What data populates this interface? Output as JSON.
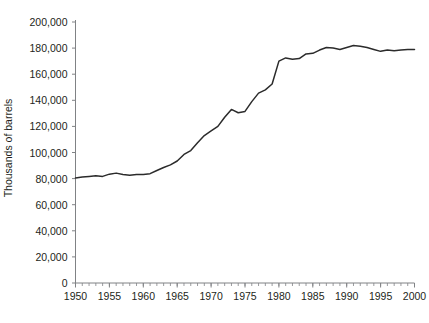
{
  "chart_data": {
    "type": "line",
    "title": "",
    "xlabel": "",
    "ylabel": "Thousands of barrels",
    "xlim": [
      1950,
      2000
    ],
    "ylim": [
      0,
      200000
    ],
    "grid": false,
    "legend": null,
    "line_color": "#2b2b2b",
    "axis_color": "#808285",
    "y_ticks": [
      0,
      20000,
      40000,
      60000,
      80000,
      100000,
      120000,
      140000,
      160000,
      180000,
      200000
    ],
    "y_tick_labels": [
      "0",
      "20,000",
      "40,000",
      "60,000",
      "80,000",
      "100,000",
      "120,000",
      "140,000",
      "160,000",
      "180,000",
      "200,000"
    ],
    "x_ticks": [
      1950,
      1955,
      1960,
      1965,
      1970,
      1975,
      1980,
      1985,
      1990,
      1995,
      2000
    ],
    "x_tick_labels": [
      "1950",
      "1955",
      "1960",
      "1965",
      "1970",
      "1975",
      "1980",
      "1985",
      "1990",
      "1995",
      "2000"
    ],
    "x_minor_tick_step": 1,
    "series": [
      {
        "name": "Petroleum products supplied",
        "x": [
          1950,
          1951,
          1952,
          1953,
          1954,
          1955,
          1956,
          1957,
          1958,
          1959,
          1960,
          1961,
          1962,
          1963,
          1964,
          1965,
          1966,
          1967,
          1968,
          1969,
          1970,
          1971,
          1972,
          1973,
          1974,
          1975,
          1976,
          1977,
          1978,
          1979,
          1980,
          1981,
          1982,
          1983,
          1984,
          1985,
          1986,
          1987,
          1988,
          1989,
          1990,
          1991,
          1992,
          1993,
          1994,
          1995,
          1996,
          1997,
          1998,
          1999,
          2000
        ],
        "values": [
          80500,
          81200,
          81600,
          82100,
          81700,
          83400,
          84200,
          83200,
          82600,
          83200,
          83100,
          83800,
          86200,
          88500,
          90500,
          93500,
          98500,
          101500,
          107500,
          113000,
          116500,
          120000,
          127000,
          133000,
          130500,
          131500,
          139000,
          145500,
          148000,
          152500,
          170000,
          172500,
          171500,
          172000,
          175500,
          176000,
          178500,
          180500,
          180000,
          179000,
          180500,
          182000,
          181500,
          180500,
          179000,
          177500,
          178500,
          178000,
          178500,
          179000,
          179000
        ]
      }
    ]
  },
  "axes": {
    "y_title": "Thousands of barrels"
  }
}
